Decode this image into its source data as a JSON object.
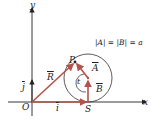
{
  "diagram": {
    "axes": {
      "x_label": "x",
      "y_label": "y",
      "origin_label": "O"
    },
    "points": {
      "P": "P",
      "S": "S"
    },
    "vectors": {
      "R": "R",
      "A": "A",
      "B": "B",
      "i": "i",
      "j": "j"
    },
    "angle_label": "t",
    "equation": "|A| = |B| = a",
    "colors": {
      "vector": "#b5524a",
      "axis": "#222222",
      "circle": "#333333"
    }
  }
}
